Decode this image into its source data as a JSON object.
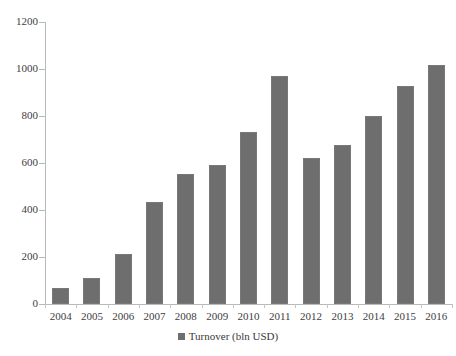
{
  "chart_data": {
    "type": "bar",
    "title": "",
    "subtitle": "",
    "xlabel": "",
    "ylabel": "",
    "categories": [
      "2004",
      "2005",
      "2006",
      "2007",
      "2008",
      "2009",
      "2010",
      "2011",
      "2012",
      "2013",
      "2014",
      "2015",
      "2016"
    ],
    "values": [
      70,
      110,
      212,
      432,
      555,
      592,
      730,
      970,
      620,
      675,
      800,
      928,
      1018
    ],
    "series": [
      {
        "name": "Turnover (bln USD)",
        "values": [
          70,
          110,
          212,
          432,
          555,
          592,
          730,
          970,
          620,
          675,
          800,
          928,
          1018
        ],
        "color": "#6e6e6e"
      }
    ],
    "ylim": [
      0,
      1200
    ],
    "yticks": [
      0,
      200,
      400,
      600,
      800,
      1000,
      1200
    ],
    "ytick_labels": [
      "0",
      "200",
      "400",
      "600",
      "800",
      "1000",
      "1200"
    ],
    "grid": false,
    "legend": {
      "position": "bottom",
      "entries": [
        {
          "label": "Turnover (bln USD)",
          "marker": "square",
          "color": "#6e6e6e"
        }
      ]
    },
    "axis_color": "#b9b9b9",
    "background": "#ffffff"
  }
}
